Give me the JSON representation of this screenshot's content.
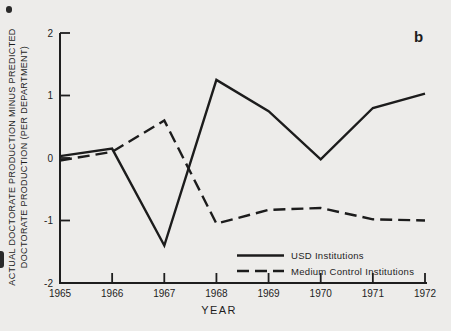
{
  "figure": {
    "panel_label": "b",
    "background": "#edecea",
    "ink": "#1e1e1e"
  },
  "chart_data": {
    "type": "line",
    "title": "",
    "xlabel": "YEAR",
    "ylabel_line1": "ACTUAL DOCTORATE PRODUCTION MINUS PREDICTED",
    "ylabel_line2": "DOCTORATE PRODUCTION (PER DEPARTMENT)",
    "x": [
      1965,
      1966,
      1967,
      1968,
      1969,
      1970,
      1971,
      1972
    ],
    "xlim": [
      1965,
      1972
    ],
    "ylim": [
      -2,
      2
    ],
    "yticks": [
      -2,
      -1,
      0,
      1,
      2
    ],
    "grid": false,
    "legend_position": "inside lower center-right",
    "series": [
      {
        "name": "USD Institutions",
        "style": "solid",
        "values": [
          0.03,
          0.15,
          -1.4,
          1.25,
          0.75,
          -0.02,
          0.8,
          1.03
        ]
      },
      {
        "name": "Medium Control Institutions",
        "style": "dashed",
        "values": [
          -0.04,
          0.1,
          0.6,
          -1.05,
          -0.83,
          -0.8,
          -0.98,
          -1.0
        ]
      }
    ]
  }
}
